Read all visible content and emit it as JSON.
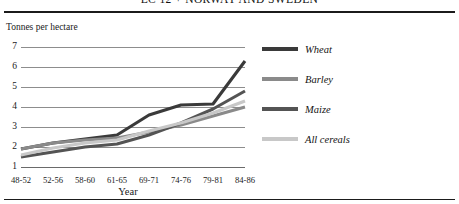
{
  "figure": {
    "title": "EC 12 + NORWAY AND SWEDEN",
    "axis_caption": "Tonnes per hectare",
    "x_axis_label": "Year"
  },
  "chart_data": {
    "type": "line",
    "title": "EC 12 + NORWAY AND SWEDEN",
    "xlabel": "Year",
    "ylabel": "Tonnes per hectare",
    "ylim": [
      1,
      7
    ],
    "grid": true,
    "legend_position": "right",
    "categories": [
      "48-52",
      "52-56",
      "58-60",
      "61-65",
      "69-71",
      "74-76",
      "79-81",
      "84-86"
    ],
    "yticks": [
      "7",
      "6",
      "5",
      "4",
      "3",
      "2",
      "1"
    ],
    "series": [
      {
        "name": "Wheat",
        "color": "#3a3a3a",
        "values": [
          1.9,
          2.2,
          2.4,
          2.6,
          3.6,
          4.1,
          4.15,
          6.3
        ]
      },
      {
        "name": "Barley",
        "color": "#8a8a8a",
        "values": [
          1.9,
          2.2,
          2.35,
          2.45,
          2.75,
          3.1,
          3.55,
          4.0
        ]
      },
      {
        "name": "Maize",
        "color": "#545454",
        "values": [
          1.5,
          1.75,
          2.0,
          2.15,
          2.6,
          3.2,
          3.9,
          4.8
        ]
      },
      {
        "name": "All cereals",
        "color": "#c8c8c8",
        "values": [
          1.6,
          1.95,
          2.2,
          2.35,
          2.8,
          3.2,
          3.7,
          4.3
        ]
      }
    ]
  },
  "legend": {
    "items": [
      {
        "label": "Wheat",
        "color": "#3a3a3a"
      },
      {
        "label": "Barley",
        "color": "#8a8a8a"
      },
      {
        "label": "Maize",
        "color": "#545454"
      },
      {
        "label": "All cereals",
        "color": "#c8c8c8"
      }
    ]
  }
}
